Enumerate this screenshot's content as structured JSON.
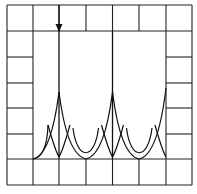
{
  "figure": {
    "grid": {
      "columns": 7,
      "rows": 7,
      "frame": "border-cells-only"
    },
    "waveform": {
      "type": "periodic-cusps",
      "cusp_columns": [
        2,
        4,
        6
      ],
      "tall_spike_columns": [
        2,
        4
      ],
      "baseline_row": 6,
      "color": "#111111"
    },
    "marker": {
      "type": "arrow-down",
      "column": 2,
      "at_row_line": 1
    },
    "line_color": "#222222",
    "background": "#ffffff"
  }
}
